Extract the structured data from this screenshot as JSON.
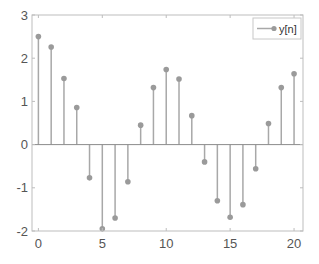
{
  "chart_data": {
    "type": "stem",
    "title": "",
    "xlabel": "",
    "ylabel": "",
    "xlim": [
      -0.5,
      20.7
    ],
    "ylim": [
      -2,
      3
    ],
    "grid": false,
    "legend_position": "upper right",
    "x": [
      0,
      1,
      2,
      3,
      4,
      5,
      6,
      7,
      8,
      9,
      10,
      11,
      12,
      13,
      14,
      15,
      16,
      17,
      18,
      19,
      20
    ],
    "series": [
      {
        "name": "y[n]",
        "values": [
          2.5,
          2.26,
          1.53,
          0.86,
          -0.77,
          -1.95,
          -1.7,
          -0.86,
          0.45,
          1.32,
          1.74,
          1.52,
          0.67,
          -0.4,
          -1.3,
          -1.68,
          -1.39,
          -0.56,
          0.49,
          1.32,
          1.64
        ]
      }
    ],
    "xticks": [
      0,
      5,
      10,
      15,
      20
    ],
    "xtick_labels": [
      "0",
      "5",
      "10",
      "15",
      "20"
    ],
    "yticks": [
      3,
      2,
      1,
      0,
      -1,
      -2
    ],
    "ytick_labels": [
      "3",
      "2",
      "1",
      "0",
      "-1",
      "-2"
    ]
  },
  "colors": {
    "stem": "#a8a8a8",
    "marker": "#9a9a9a",
    "axis": "#bdbdbd",
    "baseline": "#8c8c8c",
    "tick_text": "#555555"
  },
  "legend": {
    "label": "y[n]"
  }
}
